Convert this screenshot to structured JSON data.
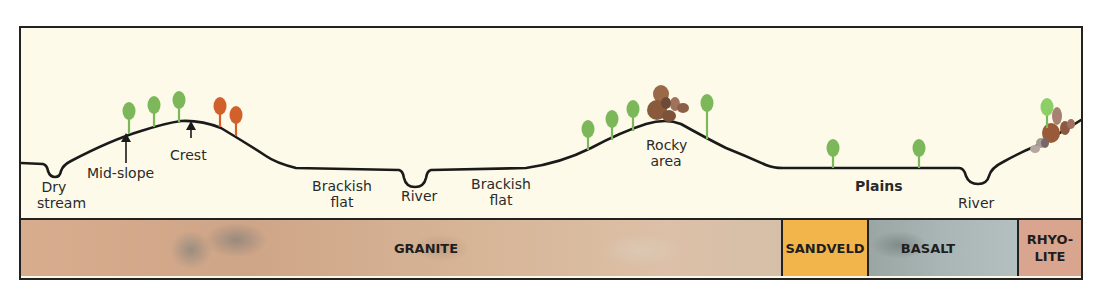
{
  "diagram": {
    "type": "landscape-cross-section",
    "colors": {
      "sky_background": "#fdfae9",
      "profile_line": "#1a1a1a",
      "tree_green": "#7cb85a",
      "tree_orange": "#d2602a",
      "rock_brown": "#8a5a3c",
      "granite": "#d4ae90",
      "sandveld": "#f2b54c",
      "basalt": "#a9b6b5",
      "rhyolite": "#d9a58e"
    },
    "landform_labels": {
      "dry_stream": "Dry\nstream",
      "dry_stream_l1": "Dry",
      "dry_stream_l2": "stream",
      "mid_slope": "Mid-slope",
      "crest": "Crest",
      "brackish_flat_1_l1": "Brackish",
      "brackish_flat_1_l2": "flat",
      "river_1": "River",
      "brackish_flat_2_l1": "Brackish",
      "brackish_flat_2_l2": "flat",
      "rocky_area_l1": "Rocky",
      "rocky_area_l2": "area",
      "plains": "Plains",
      "river_2": "River"
    },
    "geology_bands": [
      {
        "label": "GRANITE",
        "color": "#d4ae90"
      },
      {
        "label": "SANDVELD",
        "color": "#f2b54c"
      },
      {
        "label": "BASALT",
        "color": "#a9b6b5"
      },
      {
        "label_l1": "RHYO-",
        "label_l2": "LITE",
        "color": "#d9a58e"
      }
    ],
    "trees": {
      "green_count": 11,
      "orange_count": 2
    }
  }
}
